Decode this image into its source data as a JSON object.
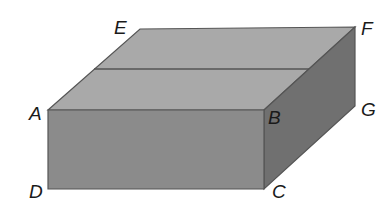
{
  "diagram": {
    "type": "rectangular-prism",
    "vertices": {
      "A": {
        "label": "A",
        "x": 48,
        "y": 110
      },
      "B": {
        "label": "B",
        "x": 264,
        "y": 110
      },
      "C": {
        "label": "C",
        "x": 264,
        "y": 189
      },
      "D": {
        "label": "D",
        "x": 48,
        "y": 189
      },
      "E": {
        "label": "E",
        "x": 140,
        "y": 29
      },
      "F": {
        "label": "F",
        "x": 355,
        "y": 27
      },
      "G": {
        "label": "G",
        "x": 355,
        "y": 106
      }
    },
    "top_midline": {
      "x1": 94,
      "y1": 69,
      "x2": 309,
      "y2": 69
    },
    "colors": {
      "top_face": "#a9a9a9",
      "front_face": "#8b8b8b",
      "side_face": "#707070",
      "edge": "#555555",
      "label": "#1a1a1a"
    }
  }
}
